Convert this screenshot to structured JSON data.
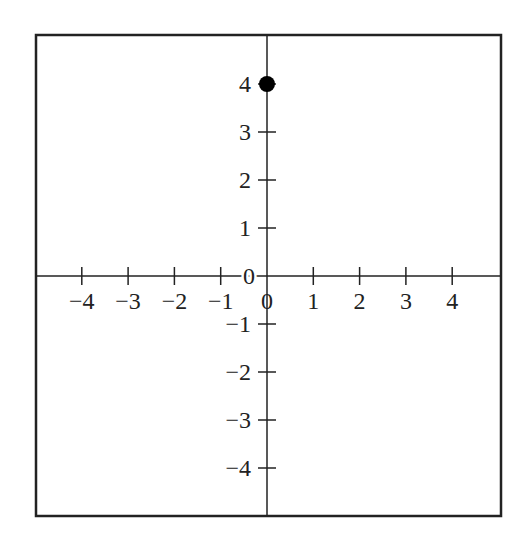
{
  "chart_data": {
    "type": "scatter",
    "title": "",
    "xlabel": "",
    "ylabel": "",
    "xlim": [
      -5,
      5
    ],
    "ylim": [
      -5,
      5
    ],
    "grid": false,
    "legend": null,
    "x_ticks": [
      -4,
      -3,
      -2,
      -1,
      0,
      1,
      2,
      3,
      4
    ],
    "y_ticks": [
      -4,
      -3,
      -2,
      -1,
      0,
      1,
      2,
      3,
      4
    ],
    "x_tick_labels": [
      "−4",
      "−3",
      "−2",
      "−1",
      "0",
      "1",
      "2",
      "3",
      "4"
    ],
    "y_tick_labels": [
      "−4",
      "−3",
      "−2",
      "−1",
      "0",
      "1",
      "2",
      "3",
      "4"
    ],
    "series": [
      {
        "name": "point",
        "points": [
          {
            "x": 0,
            "y": 4
          }
        ]
      }
    ]
  },
  "style": {
    "axis_color": "#222222",
    "frame_color": "#222222",
    "point_color": "#000000",
    "background": "#ffffff"
  },
  "layout": {
    "frame": {
      "x": 36,
      "y": 35,
      "w": 465,
      "h": 481
    },
    "origin": {
      "x": 267,
      "y": 276
    },
    "x_unit_px": 46.3,
    "y_unit_px": 48,
    "tick_half_len": 9,
    "point_radius": 8
  }
}
